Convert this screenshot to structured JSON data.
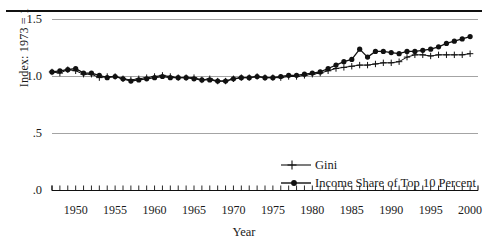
{
  "figure": {
    "caption_fragment": "",
    "ylabel": "Index: 1973 = 1",
    "xlabel": "Year"
  },
  "chart_data": {
    "type": "line",
    "title": "",
    "xlabel": "Year",
    "ylabel": "Index: 1973 = 1",
    "xlim": [
      1947,
      2001
    ],
    "ylim": [
      0.0,
      1.5
    ],
    "yticks": [
      "1.5",
      "1.0",
      ".5",
      ".0"
    ],
    "ytick_values": [
      1.5,
      1.0,
      0.5,
      0.0
    ],
    "xticks": [
      "1950",
      "1955",
      "1960",
      "1965",
      "1970",
      "1975",
      "1980",
      "1985",
      "1990",
      "1995",
      "2000"
    ],
    "xtick_values": [
      1950,
      1955,
      1960,
      1965,
      1970,
      1975,
      1980,
      1985,
      1990,
      1995,
      2000
    ],
    "grid": "horizontal",
    "legend_position": "center-right",
    "x": [
      1947,
      1948,
      1949,
      1950,
      1951,
      1952,
      1953,
      1954,
      1955,
      1956,
      1957,
      1958,
      1959,
      1960,
      1961,
      1962,
      1963,
      1964,
      1965,
      1966,
      1967,
      1968,
      1969,
      1970,
      1971,
      1972,
      1973,
      1974,
      1975,
      1976,
      1977,
      1978,
      1979,
      1980,
      1981,
      1982,
      1983,
      1984,
      1985,
      1986,
      1987,
      1988,
      1989,
      1990,
      1991,
      1992,
      1993,
      1994,
      1995,
      1996,
      1997,
      1998,
      1999,
      2000
    ],
    "series": [
      {
        "name": "Gini",
        "marker": "plus",
        "color": "#111111",
        "values": [
          1.04,
          1.03,
          1.06,
          1.05,
          1.02,
          1.02,
          0.99,
          1.0,
          1.0,
          0.98,
          0.97,
          0.98,
          0.99,
          1.0,
          1.01,
          1.0,
          0.99,
          0.99,
          0.99,
          0.97,
          0.98,
          0.96,
          0.96,
          0.98,
          0.99,
          0.99,
          1.0,
          0.99,
          0.99,
          0.99,
          1.0,
          1.0,
          1.01,
          1.02,
          1.03,
          1.05,
          1.07,
          1.08,
          1.09,
          1.1,
          1.1,
          1.11,
          1.12,
          1.12,
          1.13,
          1.17,
          1.19,
          1.19,
          1.18,
          1.19,
          1.19,
          1.19,
          1.19,
          1.2
        ]
      },
      {
        "name": "Income Share of Top 10 Percent",
        "marker": "filled-circle",
        "color": "#111111",
        "values": [
          1.04,
          1.05,
          1.06,
          1.07,
          1.03,
          1.03,
          1.01,
          0.99,
          1.0,
          0.98,
          0.96,
          0.97,
          0.98,
          0.99,
          1.0,
          0.99,
          0.99,
          0.99,
          0.98,
          0.97,
          0.97,
          0.96,
          0.96,
          0.98,
          0.99,
          0.99,
          1.0,
          0.99,
          0.99,
          1.0,
          1.01,
          1.01,
          1.02,
          1.03,
          1.04,
          1.07,
          1.1,
          1.13,
          1.15,
          1.24,
          1.17,
          1.22,
          1.22,
          1.21,
          1.2,
          1.22,
          1.22,
          1.23,
          1.24,
          1.26,
          1.29,
          1.31,
          1.33,
          1.35
        ]
      }
    ]
  }
}
